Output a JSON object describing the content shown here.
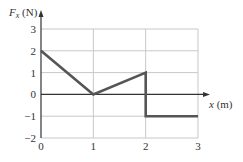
{
  "chart_data": {
    "type": "line",
    "title": "",
    "xlabel": "x (m)",
    "ylabel": "F_x (N)",
    "xlim": [
      0,
      3
    ],
    "ylim": [
      -2,
      3
    ],
    "grid": true,
    "legend": null,
    "xticks": [
      0,
      1,
      2,
      3
    ],
    "yticks": [
      -2,
      -1,
      0,
      1,
      2,
      3
    ],
    "xtick_labels": [
      "0",
      "1",
      "2",
      "3"
    ],
    "ytick_labels": [
      "−2",
      "−1",
      "0",
      "1",
      "2",
      "3"
    ],
    "series": [
      {
        "name": "F_x",
        "x": [
          0,
          1,
          2,
          2,
          3
        ],
        "y": [
          2,
          0,
          1,
          -1,
          -1
        ]
      }
    ],
    "colors": {
      "line": "#555555",
      "grid": "#c8c8c8",
      "axis": "#333333"
    }
  },
  "labels": {
    "ylabel_main": "F",
    "ylabel_sub": "x",
    "ylabel_unit": " (N)",
    "xlabel_var": "x",
    "xlabel_unit": " (m)"
  }
}
